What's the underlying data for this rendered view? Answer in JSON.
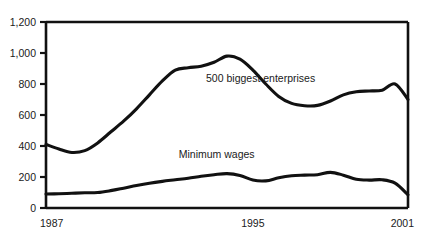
{
  "chart_data": {
    "type": "line",
    "title": "",
    "subtitle": "",
    "xlabel": "",
    "ylabel": "",
    "xlim": [
      1987,
      2001
    ],
    "ylim": [
      0,
      1200
    ],
    "grid": false,
    "legend_position": "inline-annotation",
    "y_ticks": [
      0,
      200,
      400,
      600,
      800,
      1000,
      1200
    ],
    "y_tick_labels": [
      "0",
      "200",
      "400",
      "600",
      "800",
      "1,000",
      "1,200"
    ],
    "x_ticks": [
      1987,
      1995,
      2001
    ],
    "x_tick_labels": [
      "1987",
      "1995",
      "2001"
    ],
    "x": [
      1987,
      1987.5,
      1988,
      1988.5,
      1989,
      1989.5,
      1990,
      1990.5,
      1991,
      1991.5,
      1992,
      1992.5,
      1993,
      1993.5,
      1994,
      1994.5,
      1995,
      1995.5,
      1996,
      1996.5,
      1997,
      1997.5,
      1998,
      1998.5,
      1999,
      1999.5,
      2000,
      2000.5,
      2001
    ],
    "series": [
      {
        "name": "500 biggest enterprises",
        "label_text": "500 biggest enterprises",
        "values": [
          410,
          380,
          358,
          370,
          420,
          490,
          560,
          640,
          730,
          820,
          890,
          905,
          915,
          940,
          980,
          960,
          890,
          800,
          720,
          675,
          660,
          662,
          690,
          730,
          750,
          755,
          760,
          800,
          700
        ]
      },
      {
        "name": "Minimum wages",
        "label_text": "Minimum wages",
        "values": [
          90,
          92,
          95,
          98,
          100,
          112,
          128,
          145,
          160,
          172,
          182,
          192,
          205,
          215,
          222,
          210,
          180,
          175,
          195,
          208,
          212,
          215,
          230,
          212,
          185,
          180,
          182,
          160,
          85
        ]
      }
    ],
    "annotations": [
      {
        "text": "500 biggest enterprises",
        "x": 1995.3,
        "y": 815
      },
      {
        "text": "Minimum wages",
        "x": 1993.6,
        "y": 320
      }
    ],
    "colors": {
      "line": "#111111",
      "axis": "#111111",
      "background": "#ffffff",
      "text": "#1a1a1a"
    }
  }
}
